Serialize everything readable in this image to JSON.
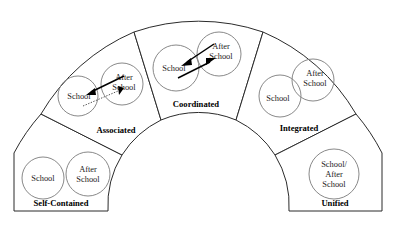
{
  "diagram": {
    "shape": "semicircular-fan",
    "segment_count": 5,
    "segments": [
      {
        "id": "self-contained",
        "label": "Self-Contained",
        "bubbles": [
          {
            "lines": [
              "School"
            ]
          },
          {
            "lines": [
              "After",
              "School"
            ]
          }
        ],
        "connectors": []
      },
      {
        "id": "associated",
        "label": "Associated",
        "bubbles": [
          {
            "lines": [
              "School"
            ]
          },
          {
            "lines": [
              "After",
              "School"
            ]
          }
        ],
        "connectors": [
          {
            "style": "solid",
            "direction": "to-school"
          },
          {
            "style": "dotted",
            "direction": "to-after-school"
          }
        ]
      },
      {
        "id": "coordinated",
        "label": "Coordinated",
        "bubbles": [
          {
            "lines": [
              "School"
            ]
          },
          {
            "lines": [
              "After",
              "School"
            ]
          }
        ],
        "connectors": [
          {
            "style": "solid",
            "direction": "to-school"
          },
          {
            "style": "solid",
            "direction": "to-after-school"
          }
        ]
      },
      {
        "id": "integrated",
        "label": "Integrated",
        "bubbles": [
          {
            "lines": [
              "School"
            ]
          },
          {
            "lines": [
              "After",
              "School"
            ]
          }
        ],
        "connectors": []
      },
      {
        "id": "unified",
        "label": "Unified",
        "bubbles": [
          {
            "lines": [
              "School/",
              "After",
              "School"
            ]
          }
        ],
        "connectors": []
      }
    ],
    "colors": {
      "outline": "#2b2b2b",
      "bubble_stroke": "#7a7a7a",
      "text": "#000000",
      "background": "#ffffff",
      "arrow": "#000000"
    }
  }
}
